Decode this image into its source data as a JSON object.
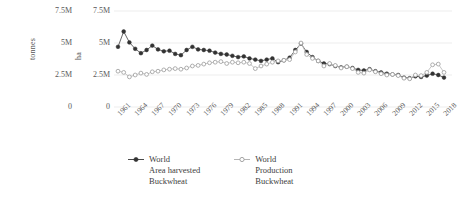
{
  "axes": {
    "left_title": "tonnes",
    "right_title": "ha",
    "yticks": [
      "7.5M",
      "5M",
      "2.5M",
      "0"
    ],
    "ytick_values": [
      7500000,
      5000000,
      2500000,
      0
    ]
  },
  "legend": [
    {
      "label": "World\nArea harvested\nBuckwheat",
      "line1": "World",
      "line2": "Area harvested",
      "line3": "Buckwheat",
      "marker": "filled-circle-marker",
      "color": "#3f3f3f"
    },
    {
      "label": "World\nProduction\nBuckwheat",
      "line1": "World",
      "line2": "Production",
      "line3": "Buckwheat",
      "marker": "open-circle-marker",
      "color": "#b0b0b0"
    }
  ],
  "chart_data": {
    "type": "line",
    "title": "",
    "xlabel": "",
    "ylabel": "tonnes / ha",
    "ylim": [
      0,
      7500000
    ],
    "ytick_labels": [
      "0",
      "2.5M",
      "5M",
      "7.5M"
    ],
    "grid": true,
    "legend_position": "bottom",
    "x": [
      1961,
      1962,
      1963,
      1964,
      1965,
      1966,
      1967,
      1968,
      1969,
      1970,
      1971,
      1972,
      1973,
      1974,
      1975,
      1976,
      1977,
      1978,
      1979,
      1980,
      1981,
      1982,
      1983,
      1984,
      1985,
      1986,
      1987,
      1988,
      1989,
      1990,
      1991,
      1992,
      1993,
      1994,
      1995,
      1996,
      1997,
      1998,
      1999,
      2000,
      2001,
      2002,
      2003,
      2004,
      2005,
      2006,
      2007,
      2008,
      2009,
      2010,
      2011,
      2012,
      2013,
      2014,
      2015,
      2016,
      2017,
      2018
    ],
    "xtick_labels": [
      "1961",
      "1964",
      "1967",
      "1970",
      "1973",
      "1976",
      "1979",
      "1982",
      "1985",
      "1988",
      "1991",
      "1994",
      "1997",
      "2000",
      "2003",
      "2006",
      "2009",
      "2012",
      "2015",
      "2018"
    ],
    "series": [
      {
        "name": "World Area harvested Buckwheat",
        "unit": "ha",
        "color": "#3f3f3f",
        "marker": "filled-circle",
        "values": [
          4700000,
          5900000,
          5050000,
          4550000,
          4200000,
          4450000,
          4800000,
          4500000,
          4350000,
          4400000,
          4150000,
          4050000,
          4450000,
          4700000,
          4500000,
          4450000,
          4400000,
          4250000,
          4150000,
          4100000,
          4000000,
          3900000,
          3950000,
          3800000,
          3700000,
          3600000,
          3700000,
          3800000,
          3500000,
          3650000,
          3850000,
          4450000,
          4950000,
          4300000,
          3900000,
          3600000,
          3400000,
          3350000,
          3200000,
          3100000,
          3150000,
          3050000,
          2900000,
          2850000,
          2950000,
          2800000,
          2700000,
          2600000,
          2550000,
          2500000,
          2300000,
          2250000,
          2400000,
          2350000,
          2450000,
          2600000,
          2500000,
          2300000
        ]
      },
      {
        "name": "World Production Buckwheat",
        "unit": "tonnes",
        "color": "#b0b0b0",
        "marker": "open-circle",
        "values": [
          2800000,
          2700000,
          2350000,
          2500000,
          2650000,
          2550000,
          2750000,
          2800000,
          2900000,
          2950000,
          3000000,
          2950000,
          3050000,
          3200000,
          3250000,
          3350000,
          3450000,
          3500000,
          3550000,
          3400000,
          3500000,
          3450000,
          3500000,
          3400000,
          3000000,
          3200000,
          3350000,
          3500000,
          3600000,
          3650000,
          3700000,
          4300000,
          5000000,
          4100000,
          3800000,
          3600000,
          3200000,
          3400000,
          3250000,
          3050000,
          3150000,
          3000000,
          2700000,
          2650000,
          2900000,
          2750000,
          2600000,
          2500000,
          2550000,
          2450000,
          2250000,
          2200000,
          2500000,
          2450000,
          2700000,
          3300000,
          3350000,
          2700000
        ]
      }
    ]
  }
}
